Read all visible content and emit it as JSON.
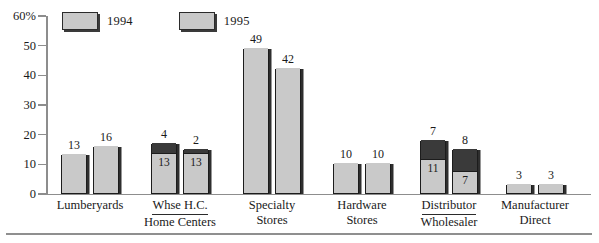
{
  "chart_data": {
    "type": "bar",
    "title": "",
    "subtitle": "",
    "xlabel": "",
    "ylabel": "",
    "ylim": [
      0,
      60
    ],
    "yunit": "%",
    "grid": false,
    "stacked": true,
    "legend_position": "top-left",
    "axis": {
      "y_ticks": [
        {
          "value": 60,
          "label": "60%"
        },
        {
          "value": 50,
          "label": "50"
        },
        {
          "value": 40,
          "label": "40"
        },
        {
          "value": 30,
          "label": "30"
        },
        {
          "value": 20,
          "label": "20"
        },
        {
          "value": 10,
          "label": "10"
        },
        {
          "value": 0,
          "label": "0"
        }
      ]
    },
    "legend": [
      {
        "name": "1994",
        "color": "#c9c9c9"
      },
      {
        "name": "1995",
        "color": "#c9c9c9"
      }
    ],
    "categories": [
      {
        "line1": "Lumberyards",
        "line2": "",
        "fraction": false
      },
      {
        "line1": "Whse H.C.",
        "line2": "Home Centers",
        "fraction": true
      },
      {
        "line1": "Specialty",
        "line2": "Stores",
        "fraction": false
      },
      {
        "line1": "Hardware",
        "line2": "Stores",
        "fraction": false
      },
      {
        "line1": "Distributor",
        "line2": "Wholesaler",
        "fraction": true
      },
      {
        "line1": "Manufacturer",
        "line2": "Direct",
        "fraction": false
      }
    ],
    "groups": [
      {
        "category": "Lumberyards",
        "bars": [
          {
            "series": "1994",
            "segments": [
              {
                "value": 13,
                "color": "#c9c9c9",
                "label_inside": false
              }
            ],
            "top_label": "13"
          },
          {
            "series": "1995",
            "segments": [
              {
                "value": 16,
                "color": "#c9c9c9",
                "label_inside": false
              }
            ],
            "top_label": "16"
          }
        ]
      },
      {
        "category": "Whse H.C. / Home Centers",
        "bars": [
          {
            "series": "1994",
            "segments": [
              {
                "value": 13,
                "color": "#c9c9c9",
                "label_inside": true,
                "label": "13"
              },
              {
                "value": 4,
                "color": "#3a3a3a",
                "label_inside": false
              }
            ],
            "top_label": "4"
          },
          {
            "series": "1995",
            "segments": [
              {
                "value": 13,
                "color": "#c9c9c9",
                "label_inside": true,
                "label": "13"
              },
              {
                "value": 2,
                "color": "#3a3a3a",
                "label_inside": false
              }
            ],
            "top_label": "2"
          }
        ]
      },
      {
        "category": "Specialty Stores",
        "bars": [
          {
            "series": "1994",
            "segments": [
              {
                "value": 49,
                "color": "#c9c9c9",
                "label_inside": false
              }
            ],
            "top_label": "49"
          },
          {
            "series": "1995",
            "segments": [
              {
                "value": 42,
                "color": "#c9c9c9",
                "label_inside": false
              }
            ],
            "top_label": "42"
          }
        ]
      },
      {
        "category": "Hardware Stores",
        "bars": [
          {
            "series": "1994",
            "segments": [
              {
                "value": 10,
                "color": "#c9c9c9",
                "label_inside": false
              }
            ],
            "top_label": "10"
          },
          {
            "series": "1995",
            "segments": [
              {
                "value": 10,
                "color": "#c9c9c9",
                "label_inside": false
              }
            ],
            "top_label": "10"
          }
        ]
      },
      {
        "category": "Distributor / Wholesaler",
        "bars": [
          {
            "series": "1994",
            "segments": [
              {
                "value": 11,
                "color": "#c9c9c9",
                "label_inside": true,
                "label": "11"
              },
              {
                "value": 7,
                "color": "#3a3a3a",
                "label_inside": false
              }
            ],
            "top_label": "7"
          },
          {
            "series": "1995",
            "segments": [
              {
                "value": 7,
                "color": "#c9c9c9",
                "label_inside": true,
                "label": "7"
              },
              {
                "value": 8,
                "color": "#3a3a3a",
                "label_inside": false
              }
            ],
            "top_label": "8"
          }
        ]
      },
      {
        "category": "Manufacturer Direct",
        "bars": [
          {
            "series": "1994",
            "segments": [
              {
                "value": 3,
                "color": "#c9c9c9",
                "label_inside": false
              }
            ],
            "top_label": "3"
          },
          {
            "series": "1995",
            "segments": [
              {
                "value": 3,
                "color": "#c9c9c9",
                "label_inside": false
              }
            ],
            "top_label": "3"
          }
        ]
      }
    ]
  },
  "colors": {
    "light_fill": "#c9c9c9",
    "dark_fill": "#3a3a3a",
    "outline": "#1c1c1c",
    "axis": "#8d8d8d",
    "text": "#1a1a1a"
  }
}
